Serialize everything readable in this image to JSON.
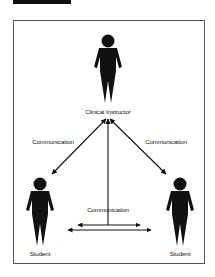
{
  "diagram": {
    "colors": {
      "ink": "#111111",
      "frame": "#555555",
      "background": "#ffffff"
    },
    "nodes": [
      {
        "id": "instructor",
        "label": "Clinical Instructor",
        "role": "person-icon"
      },
      {
        "id": "student_left",
        "label": "Student",
        "role": "person-icon"
      },
      {
        "id": "student_right",
        "label": "Student",
        "role": "person-icon"
      }
    ],
    "edges": [
      {
        "from": "instructor",
        "to": "student_left",
        "label": "Communication",
        "direction": "bidirectional"
      },
      {
        "from": "instructor",
        "to": "student_right",
        "label": "Communication",
        "direction": "bidirectional"
      },
      {
        "from": "instructor",
        "to": "student_left<->student_right",
        "label": "Communication",
        "direction": "bidirectional"
      },
      {
        "from": "student_left",
        "to": "student_right",
        "label": "",
        "direction": "bidirectional"
      }
    ],
    "labels": {
      "instructor": "Clinical Instructor",
      "student_left": "Student",
      "student_right": "Student",
      "comm_left": "Communication",
      "comm_right": "Communication",
      "comm_center": "Communication"
    }
  }
}
